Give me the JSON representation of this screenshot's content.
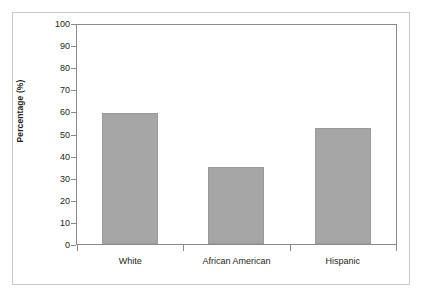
{
  "chart_data": {
    "type": "bar",
    "title": "",
    "subtitle": "",
    "xlabel": "",
    "ylabel": "Percentage (%)",
    "categories": [
      "White",
      "African American",
      "Hispanic"
    ],
    "values": [
      60,
      35,
      53
    ],
    "series": [
      {
        "name": "Percentage",
        "values": [
          60,
          35,
          53
        ]
      }
    ],
    "ylim": [
      0,
      100
    ],
    "ytick_labels": [
      "0",
      "10",
      "20",
      "30",
      "40",
      "50",
      "60",
      "70",
      "80",
      "90",
      "100"
    ],
    "ytick_values": [
      0,
      10,
      20,
      30,
      40,
      50,
      60,
      70,
      80,
      90,
      100
    ],
    "grid": false,
    "legend": null,
    "legend_position": "none",
    "annotations": [],
    "colors": {
      "bar_fill": "#a6a6a6",
      "bar_border": "#9a9a9a",
      "axis_line": "#8a8a8a",
      "outer_frame": "#c9c9c9",
      "text": "#231f20",
      "background": "#ffffff"
    }
  }
}
